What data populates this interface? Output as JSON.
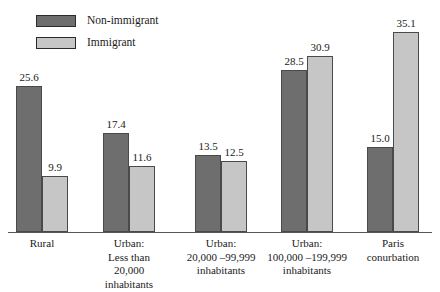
{
  "chart_data": {
    "type": "bar",
    "title": "",
    "subtitle": "",
    "xlabel": "",
    "ylabel": "",
    "ylim": [
      0,
      41.6
    ],
    "grid": false,
    "legend_position": "top-left",
    "categories": [
      "Rural",
      "Urban:\nLess than\n20,000\ninhabitants",
      "Urban:\n20,000 –99,999\ninhabitants",
      "Urban:\n100,000 –199,999\ninhabitants",
      "Paris\nconurbation"
    ],
    "series": [
      {
        "name": "Non-immigrant",
        "color": "#6e6e6e",
        "values": [
          25.6,
          17.4,
          13.5,
          28.5,
          15.0
        ],
        "labels": [
          "25.6",
          "17.4",
          "13.5",
          "28.5",
          "15.0"
        ]
      },
      {
        "name": "Immigrant",
        "color": "#c6c6c6",
        "values": [
          9.9,
          11.6,
          12.5,
          30.9,
          35.1
        ],
        "labels": [
          "9.9",
          "11.6",
          "12.5",
          "30.9",
          "35.1"
        ]
      }
    ]
  },
  "legend": {
    "items": [
      {
        "label": "Non-immigrant",
        "color": "#6e6e6e"
      },
      {
        "label": "Immigrant",
        "color": "#c6c6c6"
      }
    ]
  },
  "axis": {
    "baseline_color": "#555555"
  }
}
